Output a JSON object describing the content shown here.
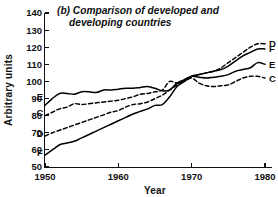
{
  "chart_data": {
    "type": "line",
    "title": "(b) Comparison of developed and developing countries",
    "title_line1": "(b) Comparison of developed and",
    "title_line2": "developing countries",
    "xlabel": "Year",
    "ylabel": "Arbitrary units",
    "xlim": [
      1950,
      1980
    ],
    "ylim": [
      50,
      140
    ],
    "xticks": [
      1950,
      1960,
      1970,
      1980
    ],
    "yticks": [
      50,
      60,
      70,
      80,
      90,
      100,
      110,
      120,
      130,
      140
    ],
    "grid": false,
    "legend_position": "inline-endpoint-labels",
    "x": [
      1950,
      1951,
      1952,
      1953,
      1954,
      1955,
      1956,
      1957,
      1958,
      1959,
      1960,
      1961,
      1962,
      1963,
      1964,
      1965,
      1966,
      1967,
      1968,
      1969,
      1970,
      1971,
      1972,
      1973,
      1974,
      1975,
      1976,
      1977,
      1978,
      1979,
      1980
    ],
    "series": [
      {
        "name": "E",
        "style": "solid",
        "label_left": "E",
        "label_right": "E",
        "values": [
          86,
          90,
          93,
          93,
          92.5,
          94,
          94,
          93.5,
          95,
          95,
          95.5,
          96,
          96,
          96.5,
          97,
          96,
          94.5,
          95,
          99,
          101,
          103,
          102.5,
          102,
          102.5,
          103,
          104,
          106,
          107,
          108,
          111,
          110
        ]
      },
      {
        "name": "C",
        "style": "dashed",
        "label_left": "C",
        "label_right": "C",
        "values": [
          80,
          82,
          84,
          85,
          87,
          86.5,
          87,
          87.5,
          88,
          88.5,
          89,
          90,
          91,
          92.5,
          93,
          94,
          95,
          100,
          99,
          100,
          102,
          99,
          97.5,
          97,
          97.5,
          98,
          100,
          102,
          103,
          103,
          102
        ]
      },
      {
        "name": "D",
        "style": "dashed",
        "label_left": "D",
        "label_right": "D",
        "values": [
          68,
          70,
          71.5,
          73,
          74.5,
          76,
          77.5,
          79,
          80.5,
          82,
          83,
          85,
          86.5,
          87,
          88,
          90,
          92,
          95,
          98,
          101,
          103,
          104,
          105,
          106,
          108,
          111,
          114,
          117,
          120,
          122,
          122
        ]
      },
      {
        "name": "F",
        "style": "solid",
        "label_left": "F",
        "label_right": "F",
        "values": [
          57,
          60,
          63,
          64,
          65,
          67,
          69,
          71,
          73,
          75,
          77,
          79,
          81,
          82.5,
          84,
          86,
          86.5,
          91,
          97,
          100,
          103,
          104,
          105,
          106,
          107,
          109,
          112,
          115,
          117,
          119,
          119
        ]
      }
    ]
  }
}
